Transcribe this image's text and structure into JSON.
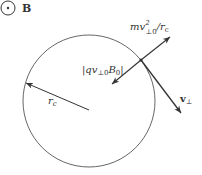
{
  "diagram": {
    "field_symbol": {
      "label": "B",
      "meaning": "magnetic field out of page"
    },
    "labels": {
      "centripetal_force": "mv²⊥₀/rᴄ",
      "centripetal_main": "mv",
      "centripetal_sup": "2",
      "centripetal_sub": "⊥0",
      "centripetal_tail": "/r",
      "centripetal_tail_sub": "c",
      "lorentz_force": "|qv⊥0B0|",
      "lorentz_open": "|qv",
      "lorentz_sub1": "⊥0",
      "lorentz_mid": "B",
      "lorentz_sub2": "0",
      "lorentz_close": "|",
      "radius_main": "r",
      "radius_sub": "c",
      "velocity_main": "v",
      "velocity_sub": "⊥"
    },
    "colors": {
      "stroke": "#333333",
      "background": "#ffffff"
    }
  }
}
